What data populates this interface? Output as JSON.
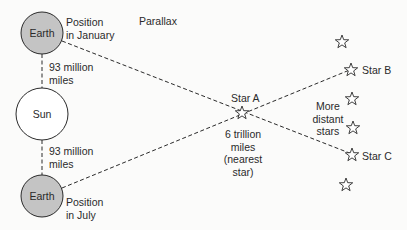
{
  "title": "Parallax",
  "earth_january": {
    "name": "Earth",
    "caption_line1": "Position",
    "caption_line2": "in January"
  },
  "sun": {
    "name": "Sun"
  },
  "earth_july": {
    "name": "Earth",
    "caption_line1": "Position",
    "caption_line2": "in July"
  },
  "distance_top": {
    "line1": "93 million",
    "line2": "miles"
  },
  "distance_bottom": {
    "line1": "93 million",
    "line2": "miles"
  },
  "star_a": {
    "label": "Star A",
    "dist_line1": "6 trillion",
    "dist_line2": "miles",
    "dist_line3": "(nearest",
    "dist_line4": "star)"
  },
  "star_b": {
    "label": "Star B"
  },
  "star_c": {
    "label": "Star C"
  },
  "distant": {
    "line1": "More",
    "line2": "distant",
    "line3": "stars"
  },
  "colors": {
    "earth_fill": "#c4c4c4",
    "sun_fill": "#ffffff",
    "stroke": "#2a2a2a",
    "background": "#fbfbfa"
  }
}
